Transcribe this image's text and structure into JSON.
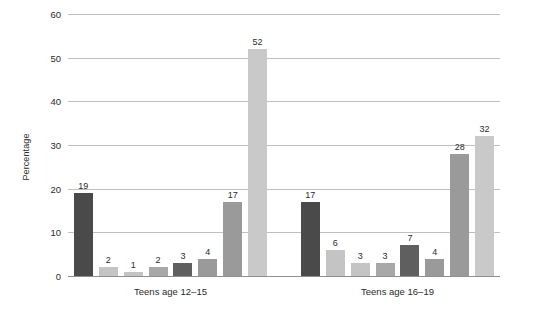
{
  "chart_data": {
    "type": "bar",
    "title": "",
    "xlabel": "",
    "ylabel": "Percentage",
    "ylim": [
      0,
      60
    ],
    "yticks": [
      0,
      10,
      20,
      30,
      40,
      50,
      60
    ],
    "grid": true,
    "legend": "none",
    "categories": [
      "Teens age 12–15",
      "Teens age 16–19"
    ],
    "groups": [
      {
        "label": "Teens age 12–15",
        "values": [
          19,
          2,
          1,
          2,
          3,
          4,
          17,
          52
        ],
        "colors": [
          "#4a4a4a",
          "#c4c4c4",
          "#c4c4c4",
          "#a8a8a8",
          "#5f5f5f",
          "#9a9a9a",
          "#9a9a9a",
          "#c9c9c9"
        ]
      },
      {
        "label": "Teens age 16–19",
        "values": [
          17,
          6,
          3,
          3,
          7,
          4,
          28,
          32
        ],
        "colors": [
          "#4a4a4a",
          "#c4c4c4",
          "#c4c4c4",
          "#a8a8a8",
          "#5f5f5f",
          "#9a9a9a",
          "#9a9a9a",
          "#c9c9c9"
        ]
      }
    ],
    "series": [
      {
        "name": "series-1",
        "values": [
          19,
          17
        ]
      },
      {
        "name": "series-2",
        "values": [
          2,
          6
        ]
      },
      {
        "name": "series-3",
        "values": [
          1,
          3
        ]
      },
      {
        "name": "series-4",
        "values": [
          2,
          3
        ]
      },
      {
        "name": "series-5",
        "values": [
          3,
          7
        ]
      },
      {
        "name": "series-6",
        "values": [
          4,
          4
        ]
      },
      {
        "name": "series-7",
        "values": [
          17,
          28
        ]
      },
      {
        "name": "series-8",
        "values": [
          52,
          32
        ]
      }
    ],
    "colors": {
      "background": "#ffffff",
      "gridline": "#bfbfbf",
      "axis": "#8f8f8f",
      "text": "#2b2b2b"
    }
  }
}
